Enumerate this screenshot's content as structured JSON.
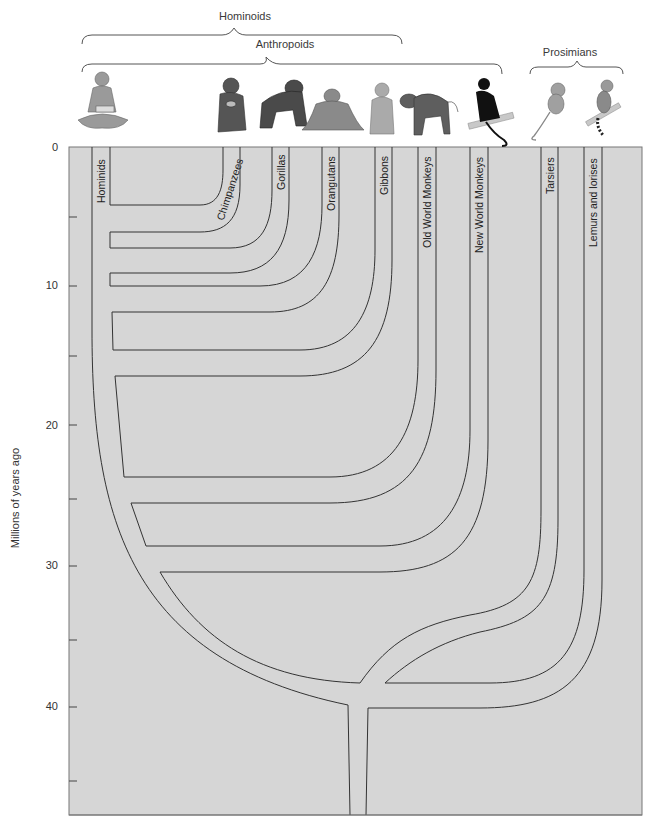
{
  "groups": {
    "hominoids": "Hominoids",
    "anthropoids": "Anthropoids",
    "prosimians": "Prosimians"
  },
  "y_axis": {
    "title": "Millions of years ago",
    "ticks": [
      "0",
      "10",
      "20",
      "30",
      "40"
    ]
  },
  "branches": [
    {
      "label": "Hominids",
      "animal": "human-icon"
    },
    {
      "label": "Chimpanzees",
      "animal": "chimpanzee-icon"
    },
    {
      "label": "Gorillas",
      "animal": "gorilla-icon"
    },
    {
      "label": "Orangutans",
      "animal": "orangutan-icon"
    },
    {
      "label": "Gibbons",
      "animal": "gibbon-icon"
    },
    {
      "label": "Old World Monkeys",
      "animal": "baboon-icon"
    },
    {
      "label": "New World Monkeys",
      "animal": "spider-monkey-icon"
    },
    {
      "label": "Tarsiers",
      "animal": "tarsier-icon"
    },
    {
      "label": "Lemurs and lorises",
      "animal": "lemur-icon"
    }
  ],
  "colors": {
    "plot_background": "#d6d6d6",
    "line": "#333333",
    "text": "#333333"
  }
}
